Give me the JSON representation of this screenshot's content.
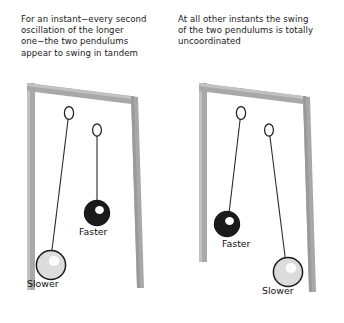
{
  "figure": {
    "panels": [
      {
        "id": "left",
        "caption": "For an instant−every second\noscillation of the longer\none−the two pendulums\nappear to swing in tandem",
        "pendulums": [
          {
            "name": "slower",
            "label": "Slower",
            "color": "#dcdcdc",
            "state": "long-pendulum-swung-left"
          },
          {
            "name": "faster",
            "label": "Faster",
            "color": "#1a1a1a",
            "state": "short-pendulum-hanging"
          }
        ]
      },
      {
        "id": "right",
        "caption": "At all other instants the swing\nof the two pendulums is totally\nuncoordinated",
        "pendulums": [
          {
            "name": "faster",
            "label": "Faster",
            "color": "#1a1a1a",
            "state": "short-pendulum-swung-left"
          },
          {
            "name": "slower",
            "label": "Slower",
            "color": "#dcdcdc",
            "state": "long-pendulum-swung-right"
          }
        ]
      }
    ],
    "colors": {
      "frame_fill": "#a8a8a8",
      "frame_highlight": "#c8c8c8",
      "frame_shadow": "#9a9a9a",
      "string": "#2b2b2b",
      "ring_stroke": "#1a1a1a",
      "ball_dark": "#1a1a1a",
      "ball_light": "#dcdcdc",
      "ball_outline": "#1a1a1a",
      "highlight": "#ffffff",
      "text": "#1a1a1a",
      "background": "#ffffff"
    }
  }
}
